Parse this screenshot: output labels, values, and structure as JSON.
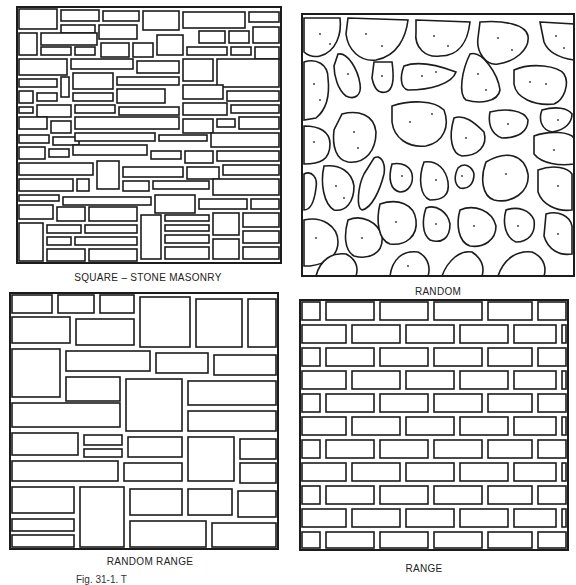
{
  "figure": {
    "caption": "Fig. 31-1. T",
    "line_color": "#1c1c1c",
    "background": "#ffffff"
  },
  "panels": [
    {
      "id": "square-stone-masonry",
      "label": "SQUARE – STONE MASONRY",
      "pattern": "square-cut rectangular stones, mixed sizes"
    },
    {
      "id": "random",
      "label": "RANDOM",
      "pattern": "irregular rounded rubble stones with stipple dots"
    },
    {
      "id": "random-range",
      "label": "RANDOM RANGE",
      "pattern": "rectangular ashlar in broken courses"
    },
    {
      "id": "range",
      "label": "RANGE",
      "pattern": "uniform running-bond courses"
    }
  ]
}
